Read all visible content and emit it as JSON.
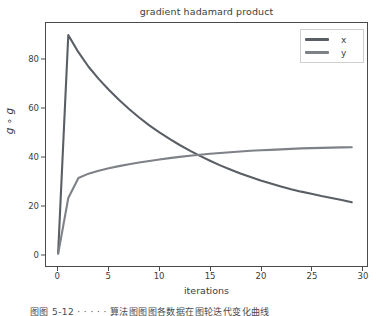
{
  "chart_data": {
    "type": "line",
    "title": "gradient hadamard product",
    "xlabel": "iterations",
    "ylabel": "g ∘ g",
    "xlim": [
      -1.2,
      30.5
    ],
    "ylim": [
      -5,
      95
    ],
    "xticks": [
      "0",
      "5",
      "10",
      "15",
      "20",
      "25",
      "30"
    ],
    "xtick_values": [
      0,
      5,
      10,
      15,
      20,
      25,
      30
    ],
    "yticks": [
      "0",
      "20",
      "40",
      "60",
      "80"
    ],
    "ytick_values": [
      0,
      20,
      40,
      60,
      80
    ],
    "grid": false,
    "legend_position": "upper right",
    "x": [
      0,
      1,
      2,
      3,
      4,
      5,
      6,
      7,
      8,
      9,
      10,
      11,
      12,
      13,
      14,
      15,
      16,
      17,
      18,
      19,
      20,
      21,
      22,
      23,
      24,
      25,
      26,
      27,
      28,
      29
    ],
    "series": [
      {
        "name": "x",
        "color": "#5a5f66",
        "values": [
          0.4,
          90.0,
          83.0,
          77.0,
          72.0,
          67.5,
          63.4,
          59.6,
          56.1,
          52.9,
          50.0,
          47.3,
          44.8,
          42.5,
          40.3,
          38.3,
          36.4,
          34.7,
          33.1,
          31.6,
          30.2,
          28.9,
          27.7,
          26.6,
          25.6,
          24.7,
          23.8,
          23.0,
          22.2,
          21.2
        ]
      },
      {
        "name": "y",
        "color": "#7e8187",
        "values": [
          0.0,
          23.0,
          31.2,
          33.0,
          34.2,
          35.2,
          36.1,
          36.9,
          37.6,
          38.2,
          38.8,
          39.4,
          39.9,
          40.4,
          40.8,
          41.2,
          41.5,
          41.8,
          42.1,
          42.4,
          42.6,
          42.8,
          43.0,
          43.2,
          43.4,
          43.5,
          43.6,
          43.7,
          43.8,
          43.9
        ]
      }
    ]
  },
  "legend": {
    "entries": [
      {
        "label": "x"
      },
      {
        "label": "y"
      }
    ]
  },
  "caption": {
    "text": "图图 5-12          · · · · ·          算法图图图各数据在图轮迭代变化曲线"
  },
  "colors": {
    "axis": "#4a4a4a",
    "text": "#3d3d3d",
    "background": "#ffffff",
    "legend_border": "#cfcfcf"
  }
}
